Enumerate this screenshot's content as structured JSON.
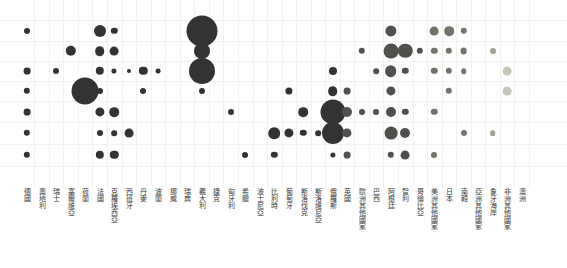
{
  "chart_data": {
    "type": "heatmap",
    "title": "",
    "subtitle": "",
    "xlabel": "",
    "ylabel": "",
    "legend_position": "none",
    "grid": true,
    "row_count": 7,
    "rows": [
      "1",
      "2",
      "3",
      "4",
      "5",
      "6",
      "7"
    ],
    "categories": [
      "德國",
      "奧地利",
      "瑞士",
      "塞爾維亞",
      "荷蘭",
      "法國",
      "克羅埃西亞",
      "西班牙",
      "丹麥",
      "波蘭",
      "挪威",
      "瑞典",
      "義大利",
      "捷克",
      "匈牙利",
      "希臘",
      "波士尼亞",
      "比利時",
      "葡萄牙",
      "斯洛伐克",
      "斯洛維尼亞",
      "俄羅斯",
      "英國",
      "歐洲其他國家",
      "巴西",
      "阿根廷",
      "智利",
      "哥倫比亞",
      "美洲其他國家",
      "日本",
      "南韓",
      "亞洲其他國家",
      "象牙海岸",
      "非洲其他國家",
      "澳洲"
    ],
    "colors": {
      "marker_dark": "#333333",
      "marker_mid": "#4f524c",
      "marker_light": "#6f7569",
      "marker_pale": "#9aa38f",
      "marker_palest": "#c2c9b8",
      "grid": "#f2f2f2",
      "background": "#ffffff",
      "label": "#3a3a3a"
    },
    "points": [
      {
        "cat": "德國",
        "row": 1,
        "r": 3.0,
        "shade": "dark"
      },
      {
        "cat": "德國",
        "row": 3,
        "r": 3.4,
        "shade": "dark"
      },
      {
        "cat": "德國",
        "row": 4,
        "r": 3.2,
        "shade": "dark"
      },
      {
        "cat": "德國",
        "row": 5,
        "r": 3.4,
        "shade": "dark"
      },
      {
        "cat": "德國",
        "row": 6,
        "r": 3.2,
        "shade": "dark"
      },
      {
        "cat": "德國",
        "row": 7,
        "r": 3.2,
        "shade": "dark"
      },
      {
        "cat": "瑞士",
        "row": 3,
        "r": 3.0,
        "shade": "dark"
      },
      {
        "cat": "塞爾維亞",
        "row": 2,
        "r": 5.2,
        "shade": "dark"
      },
      {
        "cat": "荷蘭",
        "row": 4,
        "r": 13.5,
        "shade": "dark"
      },
      {
        "cat": "法國",
        "row": 1,
        "r": 6.0,
        "shade": "dark"
      },
      {
        "cat": "法國",
        "row": 2,
        "r": 4.8,
        "shade": "dark"
      },
      {
        "cat": "法國",
        "row": 3,
        "r": 4.2,
        "shade": "dark"
      },
      {
        "cat": "法國",
        "row": 4,
        "r": 3.0,
        "shade": "dark"
      },
      {
        "cat": "法國",
        "row": 5,
        "r": 4.6,
        "shade": "dark"
      },
      {
        "cat": "法國",
        "row": 6,
        "r": 3.0,
        "shade": "dark"
      },
      {
        "cat": "法國",
        "row": 7,
        "r": 4.2,
        "shade": "dark"
      },
      {
        "cat": "克羅埃西亞",
        "row": 1,
        "r": 3.2,
        "shade": "dark"
      },
      {
        "cat": "克羅埃西亞",
        "row": 2,
        "r": 4.4,
        "shade": "dark"
      },
      {
        "cat": "克羅埃西亞",
        "row": 3,
        "r": 2.6,
        "shade": "dark"
      },
      {
        "cat": "克羅埃西亞",
        "row": 5,
        "r": 4.8,
        "shade": "dark"
      },
      {
        "cat": "克羅埃西亞",
        "row": 6,
        "r": 2.8,
        "shade": "dark"
      },
      {
        "cat": "克羅埃西亞",
        "row": 7,
        "r": 4.2,
        "shade": "dark"
      },
      {
        "cat": "西班牙",
        "row": 3,
        "r": 2.0,
        "shade": "dark"
      },
      {
        "cat": "西班牙",
        "row": 6,
        "r": 4.4,
        "shade": "dark"
      },
      {
        "cat": "丹麥",
        "row": 3,
        "r": 4.2,
        "shade": "dark"
      },
      {
        "cat": "丹麥",
        "row": 4,
        "r": 3.0,
        "shade": "dark"
      },
      {
        "cat": "波蘭",
        "row": 3,
        "r": 2.4,
        "shade": "dark"
      },
      {
        "cat": "義大利",
        "row": 1,
        "r": 15.5,
        "shade": "dark"
      },
      {
        "cat": "義大利",
        "row": 2,
        "r": 8.0,
        "shade": "dark"
      },
      {
        "cat": "義大利",
        "row": 3,
        "r": 13.0,
        "shade": "dark"
      },
      {
        "cat": "義大利",
        "row": 4,
        "r": 3.0,
        "shade": "dark"
      },
      {
        "cat": "匈牙利",
        "row": 5,
        "r": 3.0,
        "shade": "dark"
      },
      {
        "cat": "希臘",
        "row": 7,
        "r": 3.0,
        "shade": "dark"
      },
      {
        "cat": "比利時",
        "row": 6,
        "r": 5.8,
        "shade": "dark"
      },
      {
        "cat": "比利時",
        "row": 7,
        "r": 3.2,
        "shade": "dark"
      },
      {
        "cat": "葡萄牙",
        "row": 4,
        "r": 3.6,
        "shade": "dark"
      },
      {
        "cat": "葡萄牙",
        "row": 6,
        "r": 4.6,
        "shade": "dark"
      },
      {
        "cat": "斯洛伐克",
        "row": 5,
        "r": 4.8,
        "shade": "dark"
      },
      {
        "cat": "斯洛伐克",
        "row": 6,
        "r": 3.2,
        "shade": "dark"
      },
      {
        "cat": "斯洛維尼亞",
        "row": 6,
        "r": 2.8,
        "shade": "dark"
      },
      {
        "cat": "俄羅斯",
        "row": 3,
        "r": 4.0,
        "shade": "dark"
      },
      {
        "cat": "俄羅斯",
        "row": 4,
        "r": 4.8,
        "shade": "dark"
      },
      {
        "cat": "俄羅斯",
        "row": 5,
        "r": 12.5,
        "shade": "dark"
      },
      {
        "cat": "俄羅斯",
        "row": 6,
        "r": 11.0,
        "shade": "dark"
      },
      {
        "cat": "俄羅斯",
        "row": 7,
        "r": 2.6,
        "shade": "dark"
      },
      {
        "cat": "英國",
        "row": 4,
        "r": 3.4,
        "shade": "mid"
      },
      {
        "cat": "英國",
        "row": 5,
        "r": 5.0,
        "shade": "mid"
      },
      {
        "cat": "英國",
        "row": 6,
        "r": 4.6,
        "shade": "mid"
      },
      {
        "cat": "英國",
        "row": 7,
        "r": 3.4,
        "shade": "mid"
      },
      {
        "cat": "歐洲其他國家",
        "row": 2,
        "r": 3.2,
        "shade": "mid"
      },
      {
        "cat": "歐洲其他國家",
        "row": 5,
        "r": 3.0,
        "shade": "mid"
      },
      {
        "cat": "巴西",
        "row": 3,
        "r": 2.8,
        "shade": "mid"
      },
      {
        "cat": "巴西",
        "row": 5,
        "r": 3.0,
        "shade": "mid"
      },
      {
        "cat": "阿根廷",
        "row": 1,
        "r": 5.6,
        "shade": "mid"
      },
      {
        "cat": "阿根廷",
        "row": 2,
        "r": 7.4,
        "shade": "mid"
      },
      {
        "cat": "阿根廷",
        "row": 3,
        "r": 5.8,
        "shade": "mid"
      },
      {
        "cat": "阿根廷",
        "row": 4,
        "r": 4.6,
        "shade": "mid"
      },
      {
        "cat": "阿根廷",
        "row": 5,
        "r": 5.0,
        "shade": "mid"
      },
      {
        "cat": "阿根廷",
        "row": 6,
        "r": 6.4,
        "shade": "mid"
      },
      {
        "cat": "阿根廷",
        "row": 7,
        "r": 3.2,
        "shade": "mid"
      },
      {
        "cat": "智利",
        "row": 2,
        "r": 7.2,
        "shade": "mid"
      },
      {
        "cat": "智利",
        "row": 3,
        "r": 3.2,
        "shade": "mid"
      },
      {
        "cat": "智利",
        "row": 5,
        "r": 3.2,
        "shade": "mid"
      },
      {
        "cat": "智利",
        "row": 6,
        "r": 5.0,
        "shade": "mid"
      },
      {
        "cat": "智利",
        "row": 7,
        "r": 4.4,
        "shade": "mid"
      },
      {
        "cat": "哥倫比亞",
        "row": 2,
        "r": 3.2,
        "shade": "mid"
      },
      {
        "cat": "美洲其他國家",
        "row": 1,
        "r": 4.4,
        "shade": "light"
      },
      {
        "cat": "美洲其他國家",
        "row": 2,
        "r": 3.2,
        "shade": "light"
      },
      {
        "cat": "美洲其他國家",
        "row": 3,
        "r": 3.2,
        "shade": "light"
      },
      {
        "cat": "美洲其他國家",
        "row": 5,
        "r": 3.2,
        "shade": "light"
      },
      {
        "cat": "美洲其他國家",
        "row": 7,
        "r": 3.0,
        "shade": "light"
      },
      {
        "cat": "日本",
        "row": 1,
        "r": 4.8,
        "shade": "light"
      },
      {
        "cat": "日本",
        "row": 2,
        "r": 3.2,
        "shade": "light"
      },
      {
        "cat": "日本",
        "row": 3,
        "r": 3.2,
        "shade": "light"
      },
      {
        "cat": "日本",
        "row": 4,
        "r": 3.2,
        "shade": "light"
      },
      {
        "cat": "南韓",
        "row": 1,
        "r": 3.2,
        "shade": "light"
      },
      {
        "cat": "南韓",
        "row": 2,
        "r": 3.4,
        "shade": "light"
      },
      {
        "cat": "南韓",
        "row": 3,
        "r": 2.8,
        "shade": "light"
      },
      {
        "cat": "南韓",
        "row": 6,
        "r": 3.0,
        "shade": "light"
      },
      {
        "cat": "象牙海岸",
        "row": 2,
        "r": 3.0,
        "shade": "pale"
      },
      {
        "cat": "象牙海岸",
        "row": 6,
        "r": 2.8,
        "shade": "pale"
      },
      {
        "cat": "非洲其他國家",
        "row": 3,
        "r": 4.4,
        "shade": "palest"
      },
      {
        "cat": "非洲其他國家",
        "row": 4,
        "r": 4.4,
        "shade": "palest"
      }
    ]
  }
}
